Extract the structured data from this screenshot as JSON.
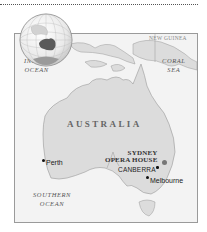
{
  "map": {
    "colors": {
      "land": "#dcdcdc",
      "sea": "#f3f3f3",
      "frame": "#9a9a9a",
      "globe_land": "#5a5a5a",
      "dotted_rule": "#555555"
    },
    "labels": {
      "continent": "AUSTRALIA",
      "countries": [
        "INDONESIA",
        "PAPUA NEW GUINEA"
      ],
      "papua_line1": "PAPUA",
      "papua_line2": "NEW GUINEA",
      "indian_ocean_line1": "INDIAN",
      "indian_ocean_line2": "OCEAN",
      "coral_sea_line1": "CORAL",
      "coral_sea_line2": "SEA",
      "southern_ocean_line1": "SOUTHERN",
      "southern_ocean_line2": "OCEAN"
    },
    "places": {
      "perth": "Perth",
      "sydney_line1": "SYDNEY",
      "sydney_line2": "OPERA HOUSE",
      "canberra": "CANBERRA",
      "melbourne": "Melbourne"
    },
    "icons": {
      "globe": "globe-icon",
      "city_marker": "dot-marker-icon",
      "landmark_marker": "large-dot-marker-icon"
    }
  }
}
